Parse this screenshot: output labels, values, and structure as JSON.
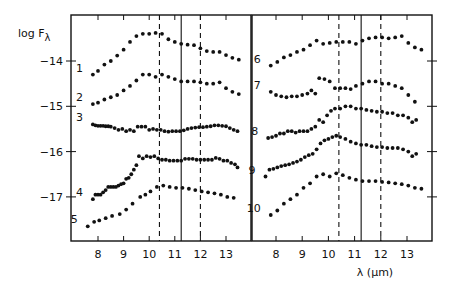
{
  "chart_data": {
    "type": "scatter",
    "title": "",
    "ylabel": "log Fλ",
    "ylabel_main": "log F",
    "ylabel_sub": "λ",
    "xlabel": "λ (μm)",
    "ylim": [
      -17.95,
      -13.0
    ],
    "xlim": [
      7.05,
      13.95
    ],
    "grid": false,
    "legend": "none",
    "y_ticks": [
      -14,
      -15,
      -16,
      -17
    ],
    "y_tick_labels": [
      "−14",
      "−15",
      "−16",
      "−17"
    ],
    "x_ticks": [
      8,
      9,
      10,
      11,
      12,
      13
    ],
    "x_tick_labels": [
      "8",
      "9",
      "10",
      "11",
      "12",
      "13"
    ],
    "reference_lines": [
      {
        "x": 10.4,
        "style": "dashed"
      },
      {
        "x": 11.25,
        "style": "solid"
      },
      {
        "x": 12.0,
        "style": "dashed"
      }
    ],
    "panels": [
      {
        "name": "left",
        "series": [
          {
            "name": "1",
            "x": [
              7.8,
              8.0,
              8.25,
              8.5,
              8.75,
              9.0,
              9.25,
              9.5,
              9.75,
              10.0,
              10.25,
              10.5,
              10.75,
              11.0,
              11.25,
              11.5,
              11.75,
              12.0,
              12.25,
              12.5,
              12.75,
              13.0,
              13.25,
              13.5
            ],
            "y": [
              -14.3,
              -14.22,
              -14.08,
              -14.0,
              -13.88,
              -13.75,
              -13.58,
              -13.45,
              -13.4,
              -13.4,
              -13.38,
              -13.4,
              -13.52,
              -13.58,
              -13.62,
              -13.64,
              -13.65,
              -13.72,
              -13.78,
              -13.8,
              -13.8,
              -13.87,
              -13.93,
              -13.97
            ]
          },
          {
            "name": "2",
            "x": [
              7.8,
              8.0,
              8.25,
              8.5,
              8.75,
              9.0,
              9.25,
              9.5,
              9.75,
              10.0,
              10.25,
              10.5,
              10.75,
              11.0,
              11.25,
              11.5,
              11.75,
              12.0,
              12.25,
              12.5,
              12.75,
              13.0,
              13.25,
              13.5
            ],
            "y": [
              -14.95,
              -14.92,
              -14.85,
              -14.8,
              -14.75,
              -14.65,
              -14.55,
              -14.43,
              -14.3,
              -14.3,
              -14.35,
              -14.3,
              -14.35,
              -14.4,
              -14.45,
              -14.45,
              -14.45,
              -14.47,
              -14.5,
              -14.5,
              -14.47,
              -14.6,
              -14.68,
              -14.73
            ]
          },
          {
            "name": "3",
            "x": [
              7.8,
              7.9,
              8.0,
              8.1,
              8.2,
              8.3,
              8.4,
              8.5,
              8.65,
              8.8,
              8.95,
              9.1,
              9.25,
              9.4,
              9.55,
              9.7,
              9.85,
              10.0,
              10.15,
              10.3,
              10.45,
              10.6,
              10.75,
              10.9,
              11.05,
              11.2,
              11.35,
              11.5,
              11.65,
              11.8,
              11.95,
              12.1,
              12.25,
              12.4,
              12.55,
              12.7,
              12.85,
              13.0,
              13.15,
              13.3,
              13.45
            ],
            "y": [
              -15.4,
              -15.42,
              -15.43,
              -15.43,
              -15.43,
              -15.44,
              -15.44,
              -15.45,
              -15.48,
              -15.52,
              -15.5,
              -15.55,
              -15.52,
              -15.55,
              -15.45,
              -15.45,
              -15.45,
              -15.52,
              -15.5,
              -15.52,
              -15.52,
              -15.55,
              -15.56,
              -15.55,
              -15.55,
              -15.55,
              -15.53,
              -15.5,
              -15.48,
              -15.47,
              -15.46,
              -15.46,
              -15.45,
              -15.44,
              -15.42,
              -15.42,
              -15.43,
              -15.44,
              -15.48,
              -15.52,
              -15.55
            ]
          },
          {
            "name": "4",
            "x": [
              7.8,
              7.9,
              8.0,
              8.1,
              8.2,
              8.3,
              8.4,
              8.5,
              8.6,
              8.7,
              8.8,
              8.9,
              9.0,
              9.1,
              9.2,
              9.3,
              9.4,
              9.5,
              9.6,
              9.75,
              9.9,
              10.05,
              10.2,
              10.35,
              10.5,
              10.65,
              10.8,
              10.95,
              11.1,
              11.25,
              11.4,
              11.55,
              11.7,
              11.85,
              12.0,
              12.15,
              12.3,
              12.45,
              12.6,
              12.75,
              12.9,
              13.05,
              13.2,
              13.35,
              13.45
            ],
            "y": [
              -17.05,
              -16.95,
              -16.95,
              -16.95,
              -16.9,
              -16.85,
              -16.78,
              -16.78,
              -16.78,
              -16.78,
              -16.75,
              -16.72,
              -16.7,
              -16.6,
              -16.58,
              -16.5,
              -16.4,
              -16.3,
              -16.1,
              -16.15,
              -16.1,
              -16.12,
              -16.1,
              -16.15,
              -16.18,
              -16.18,
              -16.2,
              -16.2,
              -16.2,
              -16.2,
              -16.16,
              -16.16,
              -16.16,
              -16.18,
              -16.18,
              -16.18,
              -16.18,
              -16.18,
              -16.14,
              -16.16,
              -16.2,
              -16.2,
              -16.25,
              -16.28,
              -16.35
            ]
          },
          {
            "name": "5",
            "x": [
              7.6,
              7.85,
              8.05,
              8.3,
              8.55,
              8.85,
              9.1,
              9.35,
              9.65,
              9.85,
              10.05,
              10.3,
              10.55,
              10.8,
              11.05,
              11.3,
              11.55,
              11.8,
              12.05,
              12.3,
              12.55,
              12.8,
              13.05,
              13.3
            ],
            "y": [
              -17.65,
              -17.55,
              -17.52,
              -17.47,
              -17.42,
              -17.38,
              -17.28,
              -17.15,
              -17.0,
              -16.95,
              -16.88,
              -16.78,
              -16.75,
              -16.78,
              -16.8,
              -16.8,
              -16.82,
              -16.85,
              -16.88,
              -16.9,
              -16.92,
              -16.95,
              -17.0,
              -17.02
            ]
          }
        ]
      },
      {
        "name": "right",
        "series": [
          {
            "name": "6",
            "x": [
              7.8,
              8.05,
              8.3,
              8.55,
              8.8,
              9.05,
              9.3,
              9.55,
              9.8,
              10.05,
              10.3,
              10.55,
              10.8,
              11.05,
              11.3,
              11.55,
              11.8,
              12.05,
              12.3,
              12.55,
              12.8,
              13.05,
              13.3,
              13.55
            ],
            "y": [
              -14.1,
              -14.02,
              -13.92,
              -13.87,
              -13.8,
              -13.75,
              -13.65,
              -13.55,
              -13.62,
              -13.6,
              -13.58,
              -13.58,
              -13.58,
              -13.62,
              -13.55,
              -13.5,
              -13.48,
              -13.48,
              -13.5,
              -13.48,
              -13.45,
              -13.6,
              -13.7,
              -13.75
            ]
          },
          {
            "name": "7",
            "x": [
              7.8,
              8.0,
              8.2,
              8.4,
              8.6,
              8.8,
              9.0,
              9.2,
              9.35,
              9.5,
              9.65,
              9.85,
              10.05,
              10.25,
              10.45,
              10.65,
              10.85,
              11.05,
              11.3,
              11.55,
              11.8,
              12.05,
              12.3,
              12.55,
              12.8,
              13.05,
              13.3
            ],
            "y": [
              -14.68,
              -14.75,
              -14.78,
              -14.8,
              -14.78,
              -14.78,
              -14.75,
              -14.72,
              -14.65,
              -14.72,
              -14.38,
              -14.4,
              -14.45,
              -14.6,
              -14.6,
              -14.6,
              -14.62,
              -14.55,
              -14.5,
              -14.45,
              -14.45,
              -14.5,
              -14.5,
              -14.55,
              -14.6,
              -14.75,
              -14.9
            ]
          },
          {
            "name": "8",
            "x": [
              7.7,
              7.85,
              8.0,
              8.15,
              8.3,
              8.45,
              8.6,
              8.75,
              8.9,
              9.05,
              9.2,
              9.35,
              9.5,
              9.65,
              9.8,
              9.95,
              10.1,
              10.25,
              10.45,
              10.65,
              10.85,
              11.05,
              11.25,
              11.45,
              11.65,
              11.85,
              12.05,
              12.25,
              12.45,
              12.65,
              12.85,
              13.05,
              13.2,
              13.35
            ],
            "y": [
              -15.7,
              -15.68,
              -15.65,
              -15.6,
              -15.6,
              -15.55,
              -15.55,
              -15.58,
              -15.55,
              -15.55,
              -15.55,
              -15.5,
              -15.45,
              -15.3,
              -15.35,
              -15.2,
              -15.1,
              -15.05,
              -15.05,
              -15.0,
              -15.0,
              -15.05,
              -15.05,
              -15.08,
              -15.1,
              -15.12,
              -15.12,
              -15.15,
              -15.15,
              -15.2,
              -15.2,
              -15.25,
              -15.35,
              -15.3
            ]
          },
          {
            "name": "9",
            "x": [
              7.6,
              7.75,
              7.9,
              8.05,
              8.2,
              8.35,
              8.5,
              8.65,
              8.8,
              8.95,
              9.1,
              9.25,
              9.4,
              9.55,
              9.7,
              9.85,
              10.0,
              10.15,
              10.3,
              10.45,
              10.65,
              10.85,
              11.05,
              11.25,
              11.45,
              11.65,
              11.85,
              12.05,
              12.25,
              12.45,
              12.65,
              12.85,
              13.05,
              13.2,
              13.35
            ],
            "y": [
              -16.55,
              -16.4,
              -16.38,
              -16.35,
              -16.32,
              -16.3,
              -16.28,
              -16.25,
              -16.22,
              -16.18,
              -16.12,
              -16.08,
              -16.05,
              -15.95,
              -15.82,
              -15.75,
              -15.72,
              -15.68,
              -15.65,
              -15.68,
              -15.72,
              -15.78,
              -15.82,
              -15.85,
              -15.85,
              -15.88,
              -15.9,
              -15.9,
              -15.92,
              -15.92,
              -15.92,
              -15.95,
              -16.0,
              -16.1,
              -16.05
            ]
          },
          {
            "name": "10",
            "x": [
              7.8,
              8.05,
              8.3,
              8.55,
              8.8,
              9.05,
              9.3,
              9.55,
              9.8,
              10.05,
              10.3,
              10.55,
              10.8,
              11.05,
              11.3,
              11.55,
              11.8,
              12.05,
              12.3,
              12.55,
              12.8,
              13.05,
              13.3,
              13.55
            ],
            "y": [
              -17.4,
              -17.3,
              -17.15,
              -17.05,
              -16.95,
              -16.8,
              -16.7,
              -16.55,
              -16.5,
              -16.55,
              -16.48,
              -16.52,
              -16.58,
              -16.62,
              -16.65,
              -16.65,
              -16.65,
              -16.67,
              -16.68,
              -16.7,
              -16.72,
              -16.75,
              -16.8,
              -16.82
            ]
          }
        ]
      }
    ],
    "curve_labels": [
      "1",
      "2",
      "3",
      "4",
      "5",
      "6",
      "7",
      "8",
      "9",
      "10"
    ]
  }
}
